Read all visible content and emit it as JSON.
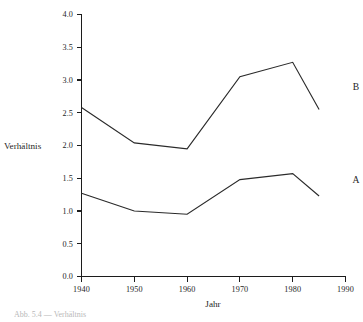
{
  "figure": {
    "background_color": "#ffffff",
    "ink_color": "#1f1f1f",
    "caption_fragment": "Abb. 5.4 — Verhältnis"
  },
  "axes": {
    "y_title": "Verhältnis",
    "x_title": "Jahr",
    "y_tick_labels": [
      "0.0",
      "0.5",
      "1.0",
      "1.5",
      "2.0",
      "2.5",
      "3.0",
      "3.5",
      "4.0"
    ],
    "x_tick_labels": [
      "1940",
      "1950",
      "1960",
      "1970",
      "1980",
      "1990"
    ]
  },
  "series_labels": {
    "upper": "B",
    "lower": "A"
  },
  "chart_data": {
    "type": "line",
    "title": "",
    "xlabel": "Jahr",
    "ylabel": "Verhältnis",
    "xlim": [
      1940,
      1990
    ],
    "ylim": [
      0.0,
      4.0
    ],
    "xticks": [
      1940,
      1950,
      1960,
      1970,
      1980,
      1990
    ],
    "yticks": [
      0.0,
      0.5,
      1.0,
      1.5,
      2.0,
      2.5,
      3.0,
      3.5,
      4.0
    ],
    "grid": false,
    "legend": "inline-right-labels",
    "series": [
      {
        "name": "B",
        "x": [
          1940,
          1950,
          1960,
          1970,
          1980,
          1985
        ],
        "values": [
          2.58,
          2.04,
          1.95,
          3.05,
          3.27,
          2.55
        ],
        "label_position": {
          "x": 1992,
          "y": 2.9
        }
      },
      {
        "name": "A",
        "x": [
          1940,
          1950,
          1960,
          1970,
          1980,
          1985
        ],
        "values": [
          1.27,
          1.0,
          0.95,
          1.48,
          1.57,
          1.23
        ],
        "label_position": {
          "x": 1992,
          "y": 1.47
        }
      }
    ]
  }
}
